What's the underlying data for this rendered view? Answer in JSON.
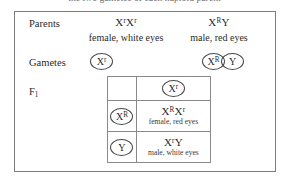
{
  "caption": {
    "text": "the two gametes of each haploid parent"
  },
  "figure": {
    "labels": {
      "parents": "Parents",
      "gametes": "Gametes",
      "f1": "F",
      "f1_subscript": "1"
    },
    "parents": [
      {
        "id": "female",
        "genotype_base1": "X",
        "genotype_sup1": "r",
        "genotype_base2": "X",
        "genotype_sup2": "r",
        "phenotype": "female, white eyes"
      },
      {
        "id": "male",
        "genotype_base1": "X",
        "genotype_sup1": "R",
        "genotype_base2": "Y",
        "genotype_sup2": "",
        "phenotype": "male, red eyes"
      }
    ],
    "gametes": {
      "female": [
        {
          "base": "X",
          "sup": "r"
        }
      ],
      "male": [
        {
          "base": "X",
          "sup": "R"
        },
        {
          "base": "Y",
          "sup": ""
        }
      ]
    },
    "punnett": {
      "column_header": {
        "base": "X",
        "sup": "r"
      },
      "rows": [
        {
          "gamete": {
            "base": "X",
            "sup": "R"
          },
          "offspring_base1": "X",
          "offspring_sup1": "R",
          "offspring_base2": "X",
          "offspring_sup2": "r",
          "offspring_phenotype": "female, red eyes"
        },
        {
          "gamete": {
            "base": "Y",
            "sup": ""
          },
          "offspring_base1": "X",
          "offspring_sup1": "r",
          "offspring_base2": "Y",
          "offspring_sup2": "",
          "offspring_phenotype": "male, white eyes"
        }
      ]
    }
  },
  "colors": {
    "frame": "#7c7c7c",
    "grid": "#8a8a8a",
    "text": "#2b2b2b",
    "caption": "#6e6e6e"
  }
}
